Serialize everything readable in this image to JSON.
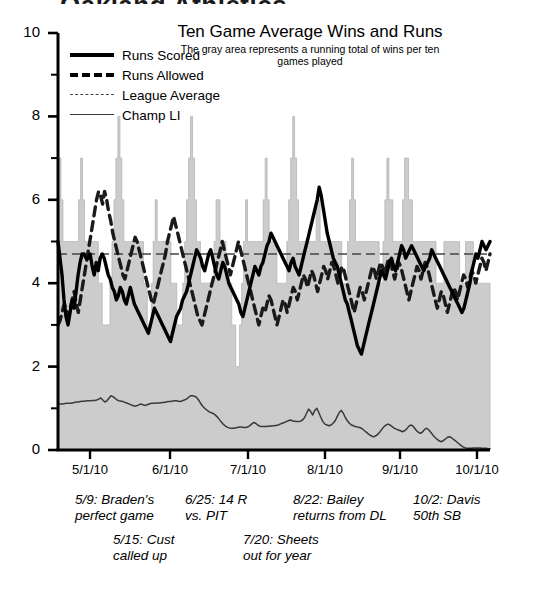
{
  "page": {
    "clipped_heading": "Oakland Athletics"
  },
  "chart_data": {
    "type": "line",
    "title": "Ten Game Average Wins and Runs",
    "subtitle": "The gray area represents a running total\nof wins per ten games played",
    "xlabel": "",
    "ylabel": "",
    "ylim": [
      0,
      10
    ],
    "ytick_labels": [
      "0",
      "2",
      "4",
      "6",
      "8",
      "10"
    ],
    "ytick_values": [
      0,
      2,
      4,
      6,
      8,
      10
    ],
    "yminor_step": 1,
    "grid": false,
    "legend_position": "upper-left",
    "x_tick_labels": [
      "5/1/10",
      "6/1/10",
      "7/1/10",
      "8/1/10",
      "9/1/10",
      "10/1/10"
    ],
    "x_tick_positions": [
      90,
      170,
      248,
      325,
      400,
      477
    ],
    "colors": {
      "runs_scored": "#000000",
      "runs_allowed": "#1a1a1a",
      "league_average": "#444444",
      "champ_li": "#3a3a3a",
      "wins_area_fill": "#cccccc",
      "wins_area_stroke": "#b5b5b5",
      "axis": "#000000"
    },
    "series": [
      {
        "name": "Wins per ten games (gray area)",
        "style": "area",
        "values": [
          7,
          7,
          6,
          5,
          5,
          5,
          5,
          5,
          5,
          5,
          5,
          6,
          7,
          6,
          5,
          5,
          5,
          5,
          5,
          5,
          5,
          4,
          4,
          3,
          3,
          3,
          3,
          4,
          5,
          6,
          7,
          8,
          7,
          6,
          5,
          5,
          5,
          5,
          5,
          5,
          5,
          5,
          5,
          5,
          4,
          4,
          3,
          3,
          4,
          5,
          6,
          5,
          5,
          5,
          5,
          5,
          5,
          5,
          4,
          4,
          4,
          3,
          3,
          3,
          4,
          5,
          6,
          7,
          8,
          7,
          6,
          5,
          5,
          4,
          4,
          4,
          4,
          4,
          4,
          4,
          5,
          6,
          6,
          5,
          5,
          5,
          4,
          4,
          4,
          3,
          3,
          2,
          2,
          3,
          4,
          5,
          6,
          5,
          5,
          5,
          5,
          5,
          5,
          5,
          5,
          6,
          7,
          6,
          5,
          5,
          5,
          5,
          4,
          4,
          4,
          4,
          4,
          5,
          6,
          7,
          8,
          7,
          6,
          5,
          5,
          5,
          5,
          5,
          5,
          5,
          5,
          5,
          6,
          6,
          5,
          5,
          5,
          5,
          5,
          5,
          5,
          5,
          5,
          5,
          5,
          4,
          4,
          4,
          5,
          6,
          7,
          6,
          5,
          5,
          5,
          5,
          5,
          5,
          5,
          5,
          5,
          5,
          5,
          5,
          4,
          4,
          5,
          6,
          7,
          6,
          6,
          5,
          5,
          5,
          5,
          5,
          6,
          7,
          7,
          6,
          6,
          5,
          5,
          5,
          5,
          5,
          5,
          5,
          5,
          5,
          5,
          5,
          5,
          4,
          4,
          4,
          4,
          5,
          5,
          5,
          5,
          5,
          5,
          5,
          5,
          4,
          4,
          4,
          5,
          5,
          5,
          5,
          4,
          4,
          4,
          4,
          4,
          4,
          4,
          4,
          4
        ]
      },
      {
        "name": "Runs Scored",
        "style": "solid-thick",
        "values": [
          5.0,
          4.6,
          4.2,
          3.6,
          3.2,
          3.0,
          3.3,
          3.6,
          3.4,
          3.8,
          4.2,
          4.5,
          4.7,
          4.7,
          4.6,
          4.6,
          4.7,
          4.4,
          4.2,
          4.5,
          4.3,
          4.6,
          4.7,
          4.6,
          4.4,
          4.2,
          4.1,
          3.9,
          3.8,
          3.6,
          3.7,
          3.9,
          3.8,
          3.6,
          3.5,
          3.7,
          3.9,
          3.7,
          3.5,
          3.4,
          3.3,
          3.2,
          3.1,
          3.0,
          2.9,
          2.8,
          3.0,
          3.2,
          3.4,
          3.3,
          3.2,
          3.1,
          3.0,
          2.9,
          2.8,
          2.7,
          2.6,
          2.8,
          3.0,
          3.2,
          3.3,
          3.4,
          3.6,
          3.7,
          3.8,
          4.0,
          4.2,
          4.4,
          4.6,
          4.8,
          4.7,
          4.6,
          4.4,
          4.3,
          4.5,
          4.7,
          4.8,
          4.6,
          4.4,
          4.2,
          4.1,
          4.3,
          4.5,
          4.4,
          4.2,
          4.0,
          3.9,
          3.8,
          3.7,
          3.6,
          3.5,
          3.3,
          3.2,
          3.4,
          3.6,
          3.8,
          4.0,
          4.2,
          4.4,
          4.3,
          4.2,
          4.4,
          4.5,
          4.7,
          4.9,
          5.0,
          5.2,
          5.1,
          5.0,
          4.9,
          4.8,
          4.7,
          4.6,
          4.5,
          4.4,
          4.3,
          4.5,
          4.6,
          4.4,
          4.3,
          4.2,
          4.4,
          4.6,
          4.8,
          5.0,
          5.2,
          5.4,
          5.6,
          5.8,
          6.0,
          6.3,
          6.1,
          5.8,
          5.5,
          5.2,
          5.0,
          4.8,
          4.6,
          4.5,
          4.4,
          4.2,
          4.0,
          3.8,
          3.6,
          3.5,
          3.3,
          3.1,
          2.9,
          2.7,
          2.5,
          2.4,
          2.3,
          2.5,
          2.7,
          2.9,
          3.1,
          3.3,
          3.5,
          3.7,
          3.9,
          4.1,
          4.3,
          4.2,
          4.1,
          4.3,
          4.5,
          4.6,
          4.4,
          4.3,
          4.5,
          4.7,
          4.9,
          4.8,
          4.6,
          4.7,
          4.8,
          4.9,
          4.8,
          4.7,
          4.6,
          4.5,
          4.4,
          4.3,
          4.4,
          4.5,
          4.6,
          4.8,
          4.7,
          4.6,
          4.5,
          4.4,
          4.3,
          4.2,
          4.1,
          4.0,
          3.9,
          3.8,
          3.7,
          3.6,
          3.5,
          3.4,
          3.3,
          3.4,
          3.6,
          3.8,
          4.0,
          4.3,
          4.5,
          4.7,
          4.6,
          4.8,
          5.0,
          4.9,
          4.8,
          4.9,
          5.0
        ]
      },
      {
        "name": "Runs Allowed",
        "style": "dashed-thick",
        "values": [
          3.0,
          3.1,
          3.3,
          3.5,
          3.4,
          3.2,
          3.4,
          3.6,
          3.8,
          3.5,
          3.3,
          3.6,
          3.9,
          4.2,
          4.5,
          4.8,
          5.1,
          5.4,
          5.7,
          6.0,
          6.2,
          6.1,
          5.9,
          6.2,
          6.0,
          5.7,
          5.5,
          5.2,
          5.0,
          4.8,
          4.6,
          4.4,
          4.2,
          4.1,
          4.3,
          4.5,
          4.7,
          4.9,
          5.1,
          5.0,
          4.8,
          4.6,
          4.4,
          4.2,
          4.0,
          3.8,
          3.6,
          3.5,
          3.7,
          3.9,
          4.1,
          4.3,
          4.5,
          4.7,
          5.0,
          5.2,
          5.4,
          5.6,
          5.4,
          5.2,
          5.0,
          4.8,
          4.6,
          4.4,
          4.2,
          4.0,
          3.8,
          3.6,
          3.4,
          3.2,
          3.1,
          3.0,
          3.2,
          3.4,
          3.6,
          3.8,
          4.0,
          4.2,
          4.4,
          4.6,
          4.8,
          5.0,
          4.8,
          4.6,
          4.4,
          4.2,
          4.4,
          4.6,
          4.8,
          5.0,
          4.8,
          4.6,
          4.4,
          4.2,
          4.0,
          3.8,
          3.6,
          3.4,
          3.2,
          3.0,
          3.2,
          3.4,
          3.3,
          3.5,
          3.7,
          3.6,
          3.4,
          3.2,
          3.0,
          3.2,
          3.4,
          3.6,
          3.5,
          3.3,
          3.5,
          3.7,
          3.9,
          3.8,
          3.6,
          3.8,
          4.0,
          4.2,
          4.1,
          3.9,
          4.1,
          4.3,
          4.2,
          4.0,
          3.8,
          4.0,
          4.2,
          4.4,
          4.3,
          4.1,
          4.3,
          4.5,
          4.4,
          4.2,
          4.0,
          4.2,
          4.4,
          4.3,
          4.1,
          3.9,
          3.7,
          3.5,
          3.3,
          3.5,
          3.7,
          3.9,
          3.8,
          3.6,
          3.8,
          4.0,
          4.2,
          4.4,
          4.3,
          4.1,
          4.3,
          4.5,
          4.4,
          4.2,
          4.4,
          4.6,
          4.5,
          4.3,
          4.1,
          4.3,
          4.5,
          4.4,
          4.2,
          4.0,
          3.8,
          3.6,
          3.8,
          4.0,
          4.2,
          4.4,
          4.3,
          4.1,
          4.3,
          4.5,
          4.4,
          4.2,
          4.0,
          3.8,
          3.6,
          3.4,
          3.6,
          3.8,
          3.7,
          3.5,
          3.3,
          3.5,
          3.7,
          3.9,
          3.8,
          3.6,
          3.8,
          4.0,
          4.2,
          4.1,
          3.9,
          4.1,
          4.3,
          4.2,
          4.0,
          4.2,
          4.4,
          4.6,
          4.5,
          4.3,
          4.5,
          4.7
        ]
      },
      {
        "name": "League Average",
        "style": "dashed-thin",
        "values": [
          4.7
        ]
      },
      {
        "name": "Champ LI",
        "style": "solid-thin",
        "values": [
          1.1,
          1.1,
          1.1,
          1.11,
          1.12,
          1.12,
          1.12,
          1.13,
          1.14,
          1.15,
          1.15,
          1.16,
          1.17,
          1.17,
          1.18,
          1.18,
          1.18,
          1.19,
          1.19,
          1.2,
          1.22,
          1.25,
          1.2,
          1.15,
          1.18,
          1.24,
          1.3,
          1.28,
          1.24,
          1.2,
          1.18,
          1.17,
          1.16,
          1.14,
          1.12,
          1.1,
          1.08,
          1.06,
          1.05,
          1.07,
          1.09,
          1.1,
          1.08,
          1.07,
          1.09,
          1.11,
          1.12,
          1.12,
          1.13,
          1.13,
          1.13,
          1.14,
          1.14,
          1.15,
          1.16,
          1.16,
          1.17,
          1.18,
          1.18,
          1.17,
          1.16,
          1.18,
          1.2,
          1.22,
          1.26,
          1.3,
          1.3,
          1.29,
          1.26,
          1.2,
          1.12,
          1.05,
          1.0,
          0.96,
          0.92,
          0.9,
          0.88,
          0.85,
          0.8,
          0.74,
          0.68,
          0.62,
          0.58,
          0.55,
          0.53,
          0.52,
          0.52,
          0.53,
          0.54,
          0.55,
          0.55,
          0.54,
          0.54,
          0.55,
          0.58,
          0.62,
          0.66,
          0.64,
          0.6,
          0.57,
          0.56,
          0.56,
          0.56,
          0.57,
          0.57,
          0.58,
          0.58,
          0.59,
          0.6,
          0.62,
          0.64,
          0.66,
          0.68,
          0.7,
          0.72,
          0.7,
          0.69,
          0.68,
          0.68,
          0.69,
          0.72,
          0.78,
          0.88,
          0.98,
          0.92,
          0.84,
          0.95,
          1.0,
          0.9,
          0.78,
          0.68,
          0.62,
          0.6,
          0.58,
          0.6,
          0.64,
          0.7,
          0.8,
          0.9,
          0.95,
          0.88,
          0.78,
          0.7,
          0.64,
          0.6,
          0.58,
          0.56,
          0.55,
          0.54,
          0.52,
          0.48,
          0.44,
          0.4,
          0.36,
          0.33,
          0.32,
          0.34,
          0.38,
          0.44,
          0.5,
          0.56,
          0.6,
          0.62,
          0.6,
          0.56,
          0.52,
          0.5,
          0.48,
          0.46,
          0.44,
          0.46,
          0.5,
          0.56,
          0.6,
          0.58,
          0.52,
          0.46,
          0.42,
          0.4,
          0.44,
          0.5,
          0.52,
          0.48,
          0.42,
          0.36,
          0.3,
          0.26,
          0.22,
          0.2,
          0.22,
          0.26,
          0.3,
          0.32,
          0.3,
          0.26,
          0.22,
          0.18,
          0.14,
          0.1,
          0.07,
          0.05,
          0.04,
          0.04,
          0.04,
          0.05,
          0.05,
          0.05,
          0.05,
          0.04,
          0.04,
          0.04,
          0.03,
          0.03
        ]
      }
    ],
    "legend_entries": [
      {
        "label": "Runs Scored",
        "style": "solid-thick"
      },
      {
        "label": "Runs Allowed",
        "style": "dashed-thick"
      },
      {
        "label": "League Average",
        "style": "dashed-thin"
      },
      {
        "label": "Champ LI",
        "style": "solid-thin"
      }
    ],
    "annotations": [
      {
        "text": "5/9: Braden's\nperfect game",
        "left": 75,
        "top": 492
      },
      {
        "text": "6/25: 14 R\nvs. PIT",
        "left": 185,
        "top": 492
      },
      {
        "text": "8/22: Bailey\nreturns from DL",
        "left": 293,
        "top": 492
      },
      {
        "text": "10/2: Davis\n50th SB",
        "left": 413,
        "top": 492
      },
      {
        "text": "5/15: Cust\ncalled up",
        "left": 113,
        "top": 532
      },
      {
        "text": "7/20: Sheets\nout for year",
        "left": 243,
        "top": 532
      }
    ]
  }
}
